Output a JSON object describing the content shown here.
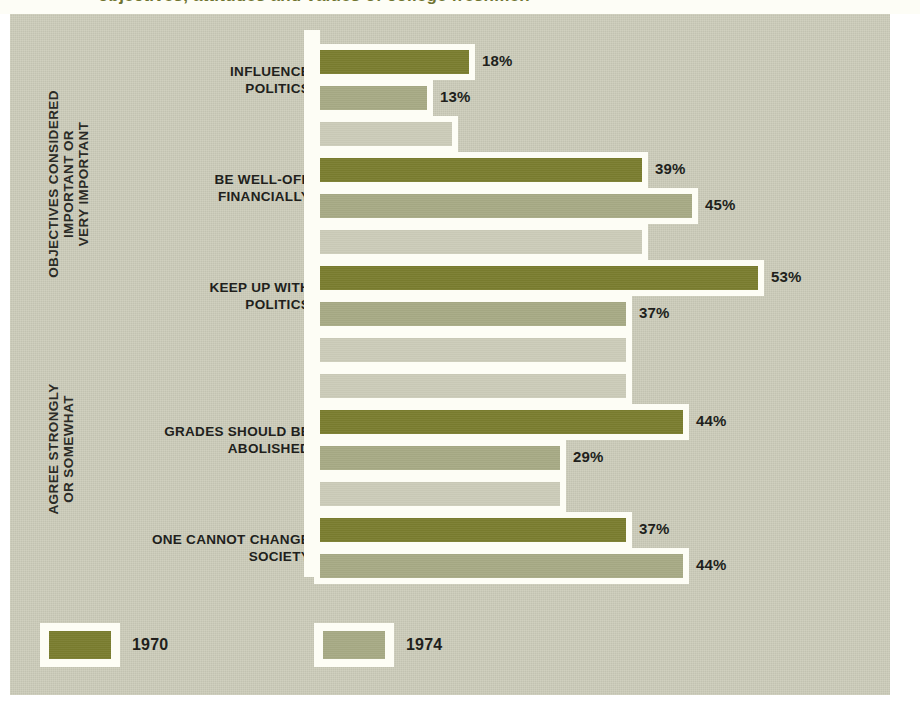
{
  "figure": {
    "background_color": "#ccccb9",
    "panel_outline_color": "#fdfdf5",
    "bleed_text": "objectives, attitudes and values of college freshmen"
  },
  "group_captions": [
    {
      "id": "objectives",
      "text": "OBJECTIVES CONSIDERED\nIMPORTANT OR\nVERY IMPORTANT"
    },
    {
      "id": "agree",
      "text": "AGREE STRONGLY\nOR SOMEWHAT"
    }
  ],
  "legend": {
    "items": [
      {
        "label": "1970",
        "color": "#7a7d2f"
      },
      {
        "label": "1974",
        "color": "#a7aa85"
      }
    ]
  },
  "categories_display": [
    "INFLUENCE\nPOLITICS",
    "BE WELL-OFF\nFINANCIALLY",
    "KEEP UP WITH\nPOLITICS",
    "GRADES SHOULD BE\nABOLISHED",
    "ONE CANNOT CHANGE\nSOCIETY"
  ],
  "value_labels": {
    "influence_politics": {
      "1970": "18%",
      "1974": "13%"
    },
    "be_well_off": {
      "1970": "39%",
      "1974": "45%"
    },
    "keep_up_politics": {
      "1970": "53%",
      "1974": "37%"
    },
    "grades_abolished": {
      "1970": "44%",
      "1974": "29%"
    },
    "cannot_change": {
      "1970": "37%",
      "1974": "44%"
    }
  },
  "chart_data": {
    "type": "bar",
    "orientation": "horizontal",
    "title": "",
    "subtitle": "",
    "xlabel": "",
    "ylabel": "",
    "xlim": [
      0,
      60
    ],
    "grid": false,
    "legend_position": "bottom-left",
    "value_format": "percent",
    "group_labels": [
      "OBJECTIVES CONSIDERED IMPORTANT OR VERY IMPORTANT",
      "AGREE STRONGLY OR SOMEWHAT"
    ],
    "categories": [
      "INFLUENCE POLITICS",
      "BE WELL-OFF FINANCIALLY",
      "KEEP UP WITH POLITICS",
      "GRADES SHOULD BE ABOLISHED",
      "ONE CANNOT CHANGE SOCIETY"
    ],
    "category_groups": [
      "OBJECTIVES CONSIDERED IMPORTANT OR VERY IMPORTANT",
      "OBJECTIVES CONSIDERED IMPORTANT OR VERY IMPORTANT",
      "OBJECTIVES CONSIDERED IMPORTANT OR VERY IMPORTANT",
      "AGREE STRONGLY OR SOMEWHAT",
      "AGREE STRONGLY OR SOMEWHAT"
    ],
    "series": [
      {
        "name": "1970",
        "color": "#7a7d2f",
        "values": [
          18,
          39,
          53,
          44,
          37
        ]
      },
      {
        "name": "1974",
        "color": "#a7aa85",
        "values": [
          13,
          45,
          37,
          29,
          44
        ]
      }
    ]
  },
  "rows": [
    {
      "kind": "bar",
      "series": "1970",
      "category": "INFLUENCE POLITICS",
      "value": 18,
      "label": "18%"
    },
    {
      "kind": "bar",
      "series": "1974",
      "category": "INFLUENCE POLITICS",
      "value": 13,
      "label": "13%"
    },
    {
      "kind": "spacer",
      "series": "",
      "category": "",
      "value": 16,
      "label": ""
    },
    {
      "kind": "bar",
      "series": "1970",
      "category": "BE WELL-OFF FINANCIALLY",
      "value": 39,
      "label": "39%"
    },
    {
      "kind": "bar",
      "series": "1974",
      "category": "BE WELL-OFF FINANCIALLY",
      "value": 45,
      "label": "45%"
    },
    {
      "kind": "spacer",
      "series": "",
      "category": "",
      "value": 39,
      "label": ""
    },
    {
      "kind": "bar",
      "series": "1970",
      "category": "KEEP UP WITH POLITICS",
      "value": 53,
      "label": "53%"
    },
    {
      "kind": "bar",
      "series": "1974",
      "category": "KEEP UP WITH POLITICS",
      "value": 37,
      "label": "37%"
    },
    {
      "kind": "spacer",
      "series": "",
      "category": "",
      "value": 37,
      "label": ""
    },
    {
      "kind": "spacer",
      "series": "",
      "category": "",
      "value": 37,
      "label": ""
    },
    {
      "kind": "bar",
      "series": "1970",
      "category": "GRADES SHOULD BE ABOLISHED",
      "value": 44,
      "label": "44%"
    },
    {
      "kind": "bar",
      "series": "1974",
      "category": "GRADES SHOULD BE ABOLISHED",
      "value": 29,
      "label": "29%"
    },
    {
      "kind": "spacer",
      "series": "",
      "category": "",
      "value": 29,
      "label": ""
    },
    {
      "kind": "bar",
      "series": "1970",
      "category": "ONE CANNOT CHANGE SOCIETY",
      "value": 37,
      "label": "37%"
    },
    {
      "kind": "bar",
      "series": "1974",
      "category": "ONE CANNOT CHANGE SOCIETY",
      "value": 44,
      "label": "44%"
    }
  ]
}
